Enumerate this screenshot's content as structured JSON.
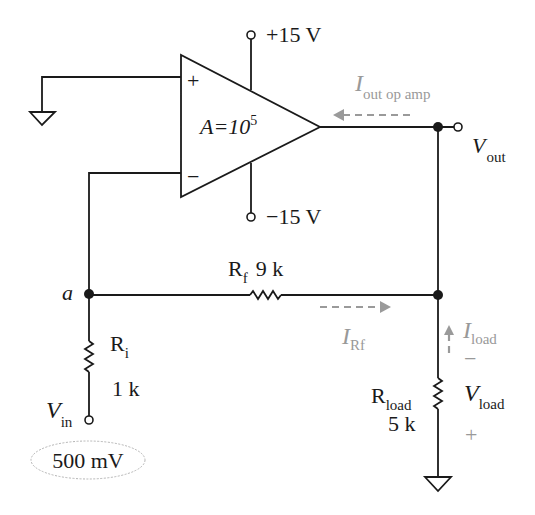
{
  "diagram": {
    "type": "inverting-op-amp-circuit",
    "colors": {
      "wire": "#1a1a1a",
      "current_arrow": "#9a9a9a",
      "background": "#ffffff"
    },
    "op_amp": {
      "gain_label": "A=10",
      "gain_exponent": "5",
      "plus_terminal": "+",
      "minus_terminal": "−"
    },
    "supplies": {
      "positive": "+15 V",
      "negative": "−15 V"
    },
    "node_a": {
      "label": "a"
    },
    "resistors": {
      "ri": {
        "name": "R",
        "sub": "i",
        "value": "1 k"
      },
      "rf": {
        "name": "R",
        "sub": "f",
        "value": "9 k"
      },
      "rload": {
        "name": "R",
        "sub": "load",
        "value": "5 k"
      }
    },
    "input": {
      "label": "V",
      "sub": "in",
      "value": "500 mV"
    },
    "output": {
      "label": "V",
      "sub": "out"
    },
    "currents": {
      "op_amp_out": {
        "label": "I",
        "sub": "out op amp"
      },
      "rf": {
        "label": "I",
        "sub": "Rf"
      },
      "load": {
        "label": "I",
        "sub": "load"
      }
    },
    "load_voltage": {
      "label": "V",
      "sub": "load",
      "minus": "−",
      "plus": "+"
    }
  }
}
